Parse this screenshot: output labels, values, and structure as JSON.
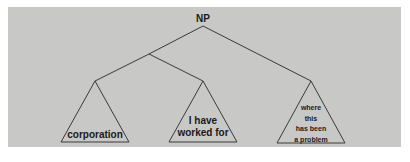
{
  "diagram": {
    "type": "syntax-tree",
    "colors": {
      "background": "#c8c8c6",
      "lines": "#3a3a3a",
      "text": "#1a1a1a"
    },
    "root": {
      "label": "NP"
    },
    "leaves": [
      {
        "lines": [
          "corporation"
        ]
      },
      {
        "lines": [
          "I have",
          "worked for"
        ]
      },
      {
        "lines": [
          "where",
          "this",
          "has been",
          "a problem"
        ]
      }
    ]
  }
}
